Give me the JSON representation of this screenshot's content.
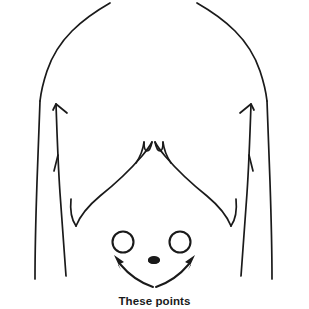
{
  "figure": {
    "kind": "anatomical-line-drawing",
    "background_color": "#ffffff",
    "ink_color": "#1a1a1a",
    "width": 309,
    "height": 302
  },
  "caption": {
    "text": "These points",
    "clipped_at_bottom_edge": true
  },
  "markers": {
    "left_point_label": "left marked point",
    "right_point_label": "right marked point",
    "navel_label": "navel"
  },
  "annotations": {
    "left_arrow_label": "curved arrow to left point",
    "right_arrow_label": "curved arrow to right point"
  },
  "anatomy": {
    "left_shoulder_label": "left shoulder contour",
    "right_shoulder_label": "right shoulder contour",
    "left_side_label": "left side body line",
    "right_side_label": "right side body line",
    "rib_cage_label": "rib cage margin",
    "xiphoid_label": "xiphoid notch",
    "left_rib_tick_label": "left rib tick mark",
    "right_rib_tick_label": "right rib tick mark"
  }
}
